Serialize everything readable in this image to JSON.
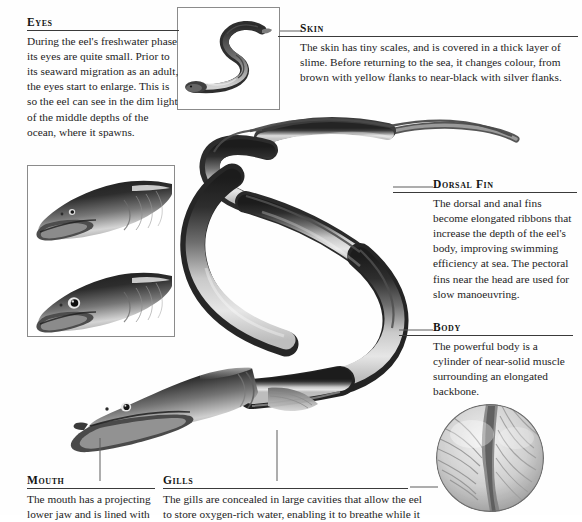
{
  "document": {
    "subject": "eel anatomy",
    "callouts": [
      {
        "id": "eyes",
        "heading": "Eyes",
        "body": "During the eel's freshwater phase its eyes are quite small. Prior to its seaward migration as an adult, the eyes start to enlarge. This is so the eel can see in the dim light of the middle depths of the ocean, where it spawns."
      },
      {
        "id": "skin",
        "heading": "Skin",
        "body": "The skin has tiny scales, and is covered in a thick layer of slime. Before returning to the sea, it changes colour, from brown with yellow flanks to near-black with silver flanks."
      },
      {
        "id": "dorsal_fin",
        "heading": "Dorsal Fin",
        "body": "The dorsal and anal fins become elongated ribbons that increase the depth of the eel's body, improving swimming efficiency at sea. The pectoral fins near the head are used for slow manoeuvring."
      },
      {
        "id": "body",
        "heading": "Body",
        "body": "The powerful body is a cylinder of near-solid muscle surrounding an elongated backbone."
      },
      {
        "id": "mouth",
        "heading": "Mouth",
        "body": "The mouth has a projecting lower jaw and is lined with"
      },
      {
        "id": "gills",
        "heading": "Gills",
        "body": "The gills are concealed in large cavities that allow the eel to store oxygen-rich water, enabling it to breathe while it"
      }
    ],
    "figures": [
      {
        "id": "whole_eel_inset",
        "name": "whole-eel-inset",
        "caption": ""
      },
      {
        "id": "eye_comparison_inset",
        "name": "eel-head-eye-comparison-inset",
        "caption": ""
      },
      {
        "id": "main_eel",
        "name": "main-eel-illustration",
        "caption": ""
      },
      {
        "id": "gill_detail",
        "name": "gill-detail-circle-inset",
        "caption": ""
      }
    ],
    "colors": {
      "page_background": "#fefefe",
      "text": "#1a1a1a",
      "rule": "#3a3a3a",
      "leader_line": "#5d5d5d",
      "frame_border": "#8b8b8b",
      "illustration_dark": "#232323",
      "illustration_mid": "#7c7c7c",
      "illustration_light": "#e8e8e8"
    }
  }
}
